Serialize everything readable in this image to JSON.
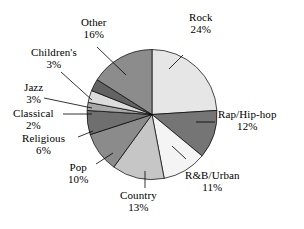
{
  "chart_data": {
    "type": "pie",
    "title": "",
    "subtitle": "",
    "xlabel": "",
    "ylabel": "",
    "legend_position": "none",
    "grid": false,
    "units": "percent",
    "start_angle_deg": 0,
    "direction": "clockwise",
    "total": 100,
    "categories": [
      "Rock",
      "Rap/Hip-hop",
      "R&B/Urban",
      "Country",
      "Pop",
      "Religious",
      "Classical",
      "Jazz",
      "Children's",
      "Other"
    ],
    "values": [
      24,
      12,
      11,
      13,
      10,
      6,
      2,
      3,
      3,
      16
    ],
    "slices": [
      {
        "label": "Rock",
        "value": 24,
        "pct_text": "24%",
        "color": "#e6e6e6"
      },
      {
        "label": "Rap/Hip-hop",
        "value": 12,
        "pct_text": "12%",
        "color": "#757575"
      },
      {
        "label": "R&B/Urban",
        "value": 11,
        "pct_text": "11%",
        "color": "#f4f4f4"
      },
      {
        "label": "Country",
        "value": 13,
        "pct_text": "13%",
        "color": "#c6c6c6"
      },
      {
        "label": "Pop",
        "value": 10,
        "pct_text": "10%",
        "color": "#8b8b8b"
      },
      {
        "label": "Religious",
        "value": 6,
        "pct_text": "6%",
        "color": "#6f6f6f"
      },
      {
        "label": "Classical",
        "value": 2,
        "pct_text": "2%",
        "color": "#a8a8a8"
      },
      {
        "label": "Jazz",
        "value": 3,
        "pct_text": "3%",
        "color": "#dcdcdc"
      },
      {
        "label": "Children's",
        "value": 3,
        "pct_text": "3%",
        "color": "#636363"
      },
      {
        "label": "Other",
        "value": 16,
        "pct_text": "16%",
        "color": "#8c8c8c"
      }
    ],
    "colors": {
      "outline": "#000000",
      "background": "#ffffff",
      "text": "#000000"
    }
  },
  "labels": {
    "rock": {
      "name": "Rock",
      "pct": "24%"
    },
    "rap": {
      "name": "Rap/Hip-hop",
      "pct": "12%"
    },
    "rnb": {
      "name": "R&B/Urban",
      "pct": "11%"
    },
    "country": {
      "name": "Country",
      "pct": "13%"
    },
    "pop": {
      "name": "Pop",
      "pct": "10%"
    },
    "religious": {
      "name": "Religious",
      "pct": "6%"
    },
    "classical": {
      "name": "Classical",
      "pct": "2%"
    },
    "jazz": {
      "name": "Jazz",
      "pct": "3%"
    },
    "childrens": {
      "name": "Children's",
      "pct": "3%"
    },
    "other": {
      "name": "Other",
      "pct": "16%"
    }
  }
}
